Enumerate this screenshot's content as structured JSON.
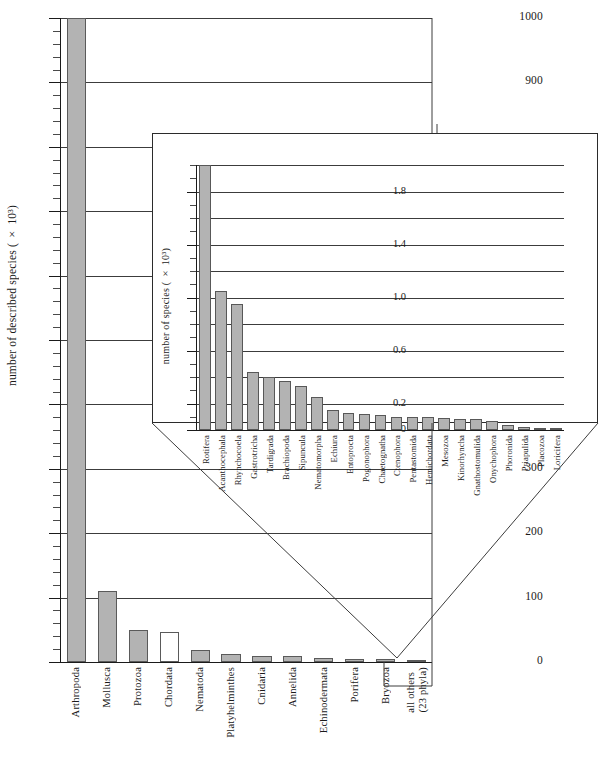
{
  "figure": {
    "type": "bar-chart-with-inset",
    "background": "#ffffff",
    "bar_fill": "#b3b3b3",
    "bar_stroke": "#585858",
    "axis_color": "#1a1a1a"
  },
  "main": {
    "ylabel": "number of described species ( × 10³)",
    "ylabel_plain": "number of described species (x 10^3)",
    "ytick_labels": [
      "0",
      "100",
      "200",
      "300",
      "400",
      "500",
      "600",
      "700",
      "800",
      "900",
      "1000"
    ],
    "ytick_values": [
      0,
      100,
      200,
      300,
      400,
      500,
      600,
      700,
      800,
      900,
      1000
    ],
    "ylim": [
      0,
      1000
    ],
    "minor_tick_step": 20,
    "categories": [
      "Arthropoda",
      "Mollusca",
      "Protozoa",
      "Chordata",
      "Nematoda",
      "Platyhelminthes",
      "Cnidaria",
      "Annelida",
      "Echinodermata",
      "Porifera",
      "Bryozoa",
      "all others\n(23 phyla)"
    ],
    "category_labels": [
      "Arthropoda",
      "Mollusca",
      "Protozoa",
      "Chordata",
      "Nematoda",
      "Platyhelminthes",
      "Cnidaria",
      "Annelida",
      "Echinodermata",
      "Porifera",
      "Bryozoa",
      "all others"
    ],
    "last_label_line2": "(23 phyla)",
    "values": [
      1000,
      110,
      50,
      47,
      18,
      13,
      9,
      9,
      6,
      5,
      4,
      3
    ],
    "fill_flags": [
      true,
      true,
      true,
      false,
      true,
      true,
      true,
      true,
      true,
      true,
      true,
      true
    ]
  },
  "inset": {
    "ylabel": "number of species ( × 10³)",
    "ylabel_plain": "number of species (x 10^3)",
    "ytick_labels": [
      "0",
      "0.2",
      "0.6",
      "1.0",
      "1.4",
      "1.8"
    ],
    "ytick_values": [
      0,
      0.2,
      0.6,
      1.0,
      1.4,
      1.8
    ],
    "gridline_values": [
      0.2,
      0.4,
      0.6,
      0.8,
      1.0,
      1.2,
      1.4,
      1.6,
      1.8,
      2.0
    ],
    "ylim": [
      0,
      2.0
    ],
    "categories": [
      "Rotifera",
      "Acanthocephala",
      "Rhynchocoela",
      "Gastrotricha",
      "Tardigrada",
      "Brachiopoda",
      "Sipuncula",
      "Nematomorpha",
      "Echiura",
      "Entoprocta",
      "Pogonophora",
      "Chaetognatha",
      "Ctenophora",
      "Pentastomida",
      "Hemichordata",
      "Mesozoa",
      "Kinorhyncha",
      "Gnathostomulida",
      "Onychophora",
      "Phoronida",
      "Priapulida",
      "Placozoa",
      "Loricifera"
    ],
    "values": [
      2.0,
      1.05,
      0.95,
      0.44,
      0.4,
      0.37,
      0.33,
      0.25,
      0.15,
      0.13,
      0.12,
      0.11,
      0.1,
      0.1,
      0.1,
      0.09,
      0.08,
      0.08,
      0.07,
      0.04,
      0.02,
      0.01,
      0.01
    ]
  },
  "chart_data": {
    "type": "bar",
    "title": "",
    "xlabel": "",
    "ylabel": "number of described species ( × 10³)",
    "ylim": [
      0,
      1000
    ],
    "categories": [
      "Arthropoda",
      "Mollusca",
      "Protozoa",
      "Chordata",
      "Nematoda",
      "Platyhelminthes",
      "Cnidaria",
      "Annelida",
      "Echinodermata",
      "Porifera",
      "Bryozoa",
      "all others (23 phyla)"
    ],
    "values": [
      1000,
      110,
      50,
      47,
      18,
      13,
      9,
      9,
      6,
      5,
      4,
      3
    ],
    "grid": true,
    "legend": "none",
    "inset": {
      "type": "bar",
      "ylabel": "number of species ( × 10³)",
      "ylim": [
        0,
        2.0
      ],
      "categories": [
        "Rotifera",
        "Acanthocephala",
        "Rhynchocoela",
        "Gastrotricha",
        "Tardigrada",
        "Brachiopoda",
        "Sipuncula",
        "Nematomorpha",
        "Echiura",
        "Entoprocta",
        "Pogonophora",
        "Chaetognatha",
        "Ctenophora",
        "Pentastomida",
        "Hemichordata",
        "Mesozoa",
        "Kinorhyncha",
        "Gnathostomulida",
        "Onychophora",
        "Phoronida",
        "Priapulida",
        "Placozoa",
        "Loricifera"
      ],
      "values": [
        2.0,
        1.05,
        0.95,
        0.44,
        0.4,
        0.37,
        0.33,
        0.25,
        0.15,
        0.13,
        0.12,
        0.11,
        0.1,
        0.1,
        0.1,
        0.09,
        0.08,
        0.08,
        0.07,
        0.04,
        0.02,
        0.01,
        0.01
      ],
      "grid": true,
      "legend": "none",
      "note": "magnified view of the 'all others (23 phyla)' column"
    }
  }
}
